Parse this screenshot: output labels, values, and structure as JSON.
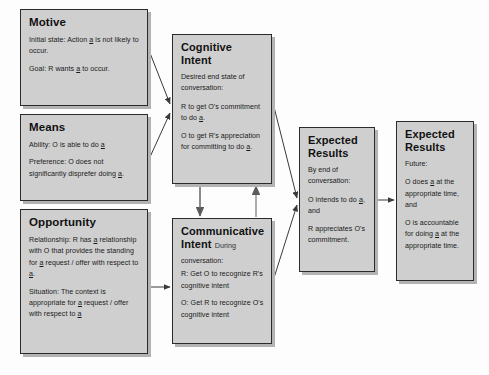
{
  "diagram": {
    "colors": {
      "box_fill": "#cfcfcf",
      "box_border": "#2b2b2b",
      "shadow": "#b3b3b3",
      "arrow": "#3a3a3a",
      "background": "#fdfdfd"
    },
    "boxes": {
      "motive": {
        "title": "Motive",
        "lines": [
          "Initial state: Action a is not likely to occur.",
          "Goal: R wants a to occur."
        ]
      },
      "means": {
        "title": "Means",
        "lines": [
          "Ability: O is able to do a",
          "Preference: O does not significantly disprefer doing a."
        ]
      },
      "opportunity": {
        "title": "Opportunity",
        "lines": [
          "Relationship: R has a relationship with O that provides the standing for a request / offer with respect to a.",
          "Situation:  The context is appropriate for a request / offer with respect to a"
        ]
      },
      "cognitive_intent": {
        "title": "Cognitive Intent",
        "lead": "Desired end state of conversation:",
        "lines": [
          "R to get O's commitment to do a.",
          "O to get R's appreciation for committing to do a."
        ]
      },
      "communicative_intent": {
        "title": "Communicative Intent",
        "title_note": "During",
        "lead": "conversation:",
        "lines": [
          "R: Get O to recognize R's cognitive intent",
          "O: Get R to  recognize O's cognitive intent"
        ]
      },
      "expected_results_1": {
        "title": "Expected Results",
        "lead": "By end of conversation:",
        "lines": [
          "O intends to do a, and",
          "R appreciates O's commitment."
        ]
      },
      "expected_results_2": {
        "title": "Expected Results",
        "lead": "Future:",
        "lines": [
          "O does a at the appropriate time, and",
          "O is accountable for doing a at the appropriate time."
        ]
      }
    },
    "connections": [
      {
        "name": "motive-to-cognitive-intent",
        "from": "motive",
        "to": "cognitive_intent",
        "style": "diagonal"
      },
      {
        "name": "means-to-cognitive-intent",
        "from": "means",
        "to": "cognitive_intent",
        "style": "diagonal"
      },
      {
        "name": "opportunity-to-communicative-intent",
        "from": "opportunity",
        "to": "communicative_intent",
        "style": "horizontal"
      },
      {
        "name": "cognitive-intent-to-communicative-intent",
        "from": "cognitive_intent",
        "to": "communicative_intent",
        "style": "vertical-down"
      },
      {
        "name": "communicative-intent-to-cognitive-intent",
        "from": "communicative_intent",
        "to": "cognitive_intent",
        "style": "vertical-up"
      },
      {
        "name": "cognitive-intent-to-expected-results",
        "from": "cognitive_intent",
        "to": "expected_results_1",
        "style": "diagonal"
      },
      {
        "name": "communicative-intent-to-expected-results",
        "from": "communicative_intent",
        "to": "expected_results_1",
        "style": "diagonal"
      },
      {
        "name": "expected-results-to-future-results",
        "from": "expected_results_1",
        "to": "expected_results_2",
        "style": "horizontal"
      }
    ]
  }
}
